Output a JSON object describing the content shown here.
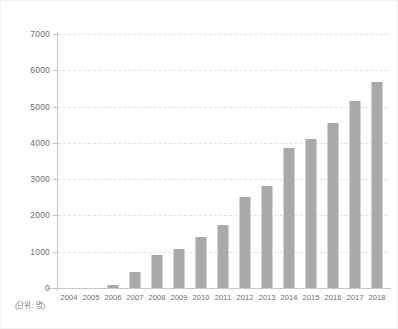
{
  "chart_data": {
    "type": "bar",
    "title": "",
    "xlabel": "",
    "ylabel": "",
    "unit_label": "(단위: 명)",
    "ylim": [
      0,
      7000
    ],
    "ytick_values": [
      0,
      1000,
      2000,
      3000,
      4000,
      5000,
      6000,
      7000
    ],
    "ytick_labels": [
      "0",
      "1000",
      "2000",
      "3000",
      "4000",
      "5000",
      "6000",
      "7000"
    ],
    "grid": true,
    "legend": null,
    "bar_color": "#a9a9a9",
    "axis_color": "#c9c9c9",
    "grid_color": "#e3e3e3",
    "categories": [
      "2004",
      "2005",
      "2006",
      "2007",
      "2008",
      "2009",
      "2010",
      "2011",
      "2012",
      "2013",
      "2014",
      "2015",
      "2016",
      "2017",
      "2018"
    ],
    "values": [
      0,
      0,
      70,
      450,
      920,
      1080,
      1400,
      1750,
      2500,
      2800,
      3850,
      4100,
      4550,
      5150,
      5680
    ]
  }
}
